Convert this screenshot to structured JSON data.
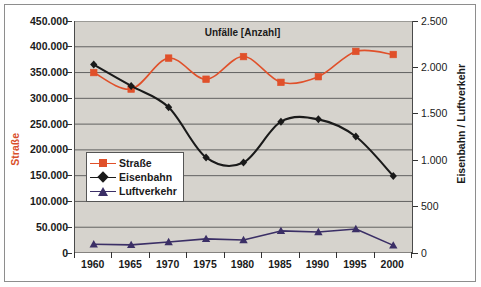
{
  "chart_data": {
    "type": "line",
    "title": "Unfälle [Anzahl]",
    "xlabel": "",
    "ylabel": "Straße",
    "ylabel_right": "Eisenbahn / Luftverkehr",
    "grid": true,
    "legend_position": "inside-left",
    "categories": [
      "1960",
      "1965",
      "1970",
      "1975",
      "1980",
      "1985",
      "1990",
      "1995",
      "2000"
    ],
    "axis_left": {
      "label": "Straße",
      "ticks": [
        "0",
        "50.000",
        "100.000",
        "150.000",
        "200.000",
        "250.000",
        "300.000",
        "350.000",
        "400.000",
        "450.000"
      ],
      "min": 0,
      "max": 450000,
      "step": 50000,
      "color": "#d9502b"
    },
    "axis_right": {
      "label": "Eisenbahn / Luftverkehr",
      "ticks": [
        "0",
        "500",
        "1.000",
        "1.500",
        "2.000",
        "2.500"
      ],
      "min": 0,
      "max": 2500,
      "step": 500,
      "color": "#1a1a1a"
    },
    "series": [
      {
        "name": "Straße",
        "axis": "left",
        "color": "#e0502a",
        "marker": "square",
        "smooth": true,
        "values": [
          350000,
          318000,
          378000,
          337000,
          381000,
          331000,
          342000,
          391000,
          385000
        ]
      },
      {
        "name": "Eisenbahn",
        "axis": "right",
        "color": "#1a1a1a",
        "marker": "diamond",
        "smooth": true,
        "values": [
          2030,
          1800,
          1570,
          1030,
          975,
          1415,
          1440,
          1255,
          830
        ]
      },
      {
        "name": "Luftverkehr",
        "axis": "right",
        "color": "#3b2f66",
        "marker": "triangle",
        "smooth": false,
        "values": [
          95,
          88,
          118,
          152,
          140,
          238,
          227,
          258,
          82
        ]
      }
    ]
  },
  "legend": {
    "items": [
      {
        "label": "Straße"
      },
      {
        "label": "Eisenbahn"
      },
      {
        "label": "Luftverkehr"
      }
    ]
  },
  "colors": {
    "plot_background": "#d6d3cd",
    "page_background": "#ffffff",
    "gridline": "#555555",
    "axis": "#333333",
    "frame": "#8d8d8d"
  }
}
